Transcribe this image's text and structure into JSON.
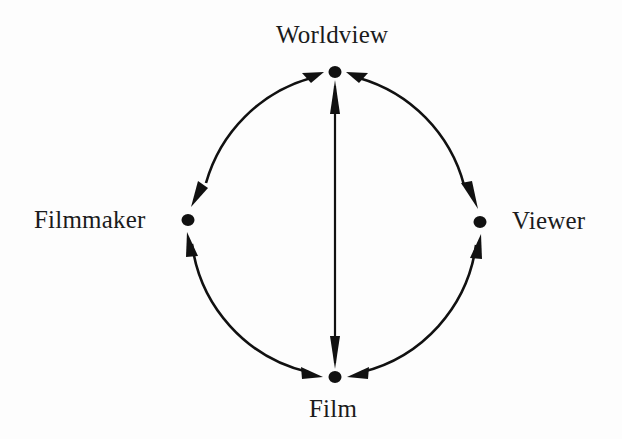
{
  "figure": {
    "type": "cycle-diagram",
    "background_color": "#fdfdfd",
    "ink_color": "#111111"
  },
  "nodes": [
    {
      "id": "worldview",
      "label": "Worldview",
      "position": "top",
      "x": 335,
      "y": 72
    },
    {
      "id": "filmmaker",
      "label": "Filmmaker",
      "position": "left",
      "x": 188,
      "y": 220
    },
    {
      "id": "viewer",
      "label": "Viewer",
      "position": "right",
      "x": 480,
      "y": 222
    },
    {
      "id": "film",
      "label": "Film",
      "position": "bottom",
      "x": 335,
      "y": 377
    }
  ],
  "edges": [
    {
      "id": "edge-worldview-filmmaker",
      "from": "Worldview",
      "to": "Filmmaker",
      "shape": "arc",
      "arrowheads": "both"
    },
    {
      "id": "edge-worldview-viewer",
      "from": "Worldview",
      "to": "Viewer",
      "shape": "arc",
      "arrowheads": "both"
    },
    {
      "id": "edge-filmmaker-film",
      "from": "Filmmaker",
      "to": "Film",
      "shape": "arc",
      "arrowheads": "both"
    },
    {
      "id": "edge-viewer-film",
      "from": "Viewer",
      "to": "Film",
      "shape": "arc",
      "arrowheads": "both"
    },
    {
      "id": "edge-worldview-film",
      "from": "Worldview",
      "to": "Film",
      "shape": "straight",
      "arrowheads": "both"
    }
  ],
  "geometry": {
    "center_x": 334,
    "center_y": 224,
    "radius": 152,
    "node_radius": 6,
    "stroke_width": 2.6
  }
}
